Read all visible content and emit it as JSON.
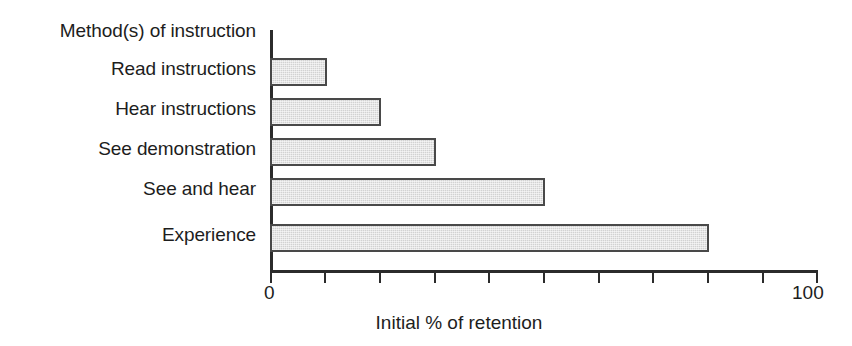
{
  "chart_data": {
    "type": "bar",
    "orientation": "horizontal",
    "title": "Method(s) of instruction",
    "xlabel": "Initial % of retention",
    "ylabel": "",
    "categories": [
      "Read instructions",
      "Hear instructions",
      "See demonstration",
      "See and hear",
      "Experience"
    ],
    "values": [
      10,
      20,
      30,
      50,
      80
    ],
    "xlim": [
      0,
      100
    ],
    "tick_labels": [
      "0",
      "100"
    ],
    "tick_values": [
      0,
      10,
      20,
      30,
      40,
      50,
      60,
      70,
      80,
      90,
      100
    ],
    "grid": false,
    "legend": false,
    "bar_fill_color": "#d2d2d2",
    "bar_border_color": "#494949",
    "axis_color": "#2b2b2b",
    "background_color": "#ffffff"
  }
}
